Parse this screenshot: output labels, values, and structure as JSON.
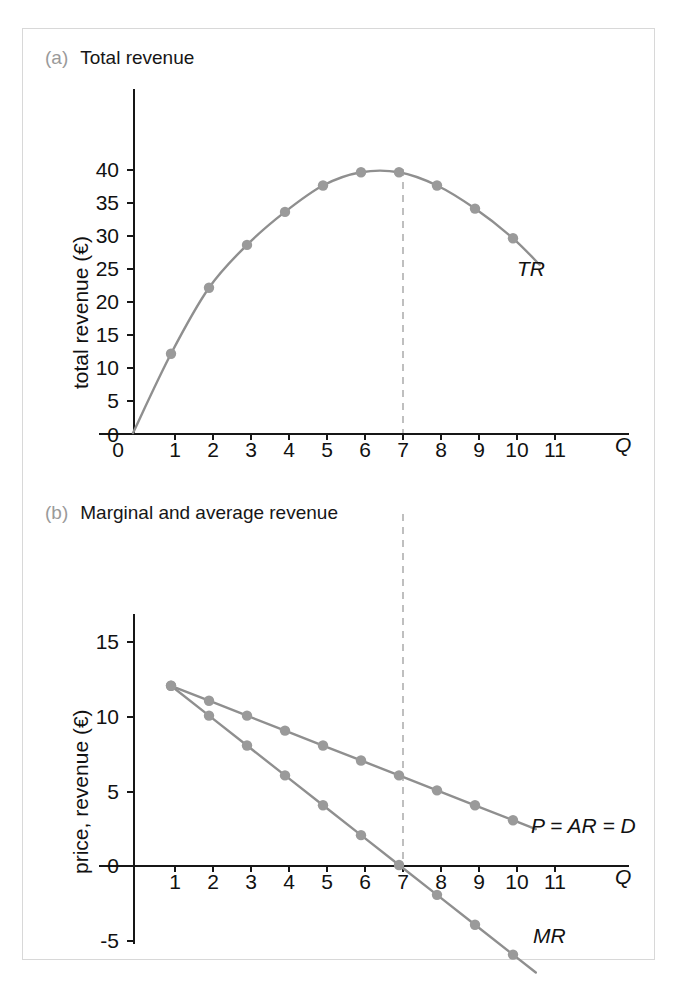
{
  "figure": {
    "panels": [
      {
        "tag": "(a)",
        "title": "Total revenue",
        "xlabel": "Q",
        "ylabel": "total revenue (€)",
        "curve_label": "TR"
      },
      {
        "tag": "(b)",
        "title": "Marginal and average revenue",
        "xlabel": "Q",
        "ylabel": "price, revenue (€)",
        "ar_label": "P = AR = D",
        "mr_label": "MR"
      }
    ],
    "colors": {
      "curve": "#8f8f8f",
      "point": "#9a9a9a",
      "axis": "#171717",
      "dashed_guide": "#b0b0b0",
      "panel_tag": "#9a9a9a",
      "frame": "#d8d8d8"
    },
    "guide_q": 7
  },
  "chart_data": [
    {
      "type": "line",
      "title": "Total revenue",
      "xlabel": "Q",
      "ylabel": "total revenue (€)",
      "xlim": [
        0,
        11.9
      ],
      "ylim": [
        0,
        44
      ],
      "xticks": [
        0,
        1,
        2,
        3,
        4,
        5,
        6,
        7,
        8,
        9,
        10,
        11
      ],
      "xtick_labels": [
        "0",
        "1",
        "2",
        "3",
        "4",
        "5",
        "6",
        "7",
        "8",
        "9",
        "10",
        "11"
      ],
      "yticks": [
        0,
        5,
        10,
        15,
        20,
        25,
        30,
        35,
        40
      ],
      "ytick_labels": [
        "0",
        "5",
        "10",
        "15",
        "20",
        "25",
        "30",
        "35",
        "40"
      ],
      "grid": false,
      "legend": "inline-curve-label",
      "series": [
        {
          "name": "TR",
          "x": [
            1,
            2,
            3,
            4,
            5,
            6,
            7,
            8,
            9,
            10
          ],
          "values": [
            12,
            22,
            28.5,
            33.5,
            37.5,
            39.5,
            39.5,
            37.5,
            34,
            29.5
          ]
        }
      ],
      "annotations": [
        {
          "text": "TR",
          "x": 10.4,
          "y": 26
        },
        {
          "text": "dashed vertical guide at Q = 7",
          "x": 7,
          "y": 39.5
        }
      ]
    },
    {
      "type": "line",
      "title": "Marginal and average revenue",
      "xlabel": "Q",
      "ylabel": "price, revenue (€)",
      "xlim": [
        0,
        11.9
      ],
      "ylim": [
        -6.5,
        17
      ],
      "xticks": [
        1,
        2,
        3,
        4,
        5,
        6,
        7,
        8,
        9,
        10,
        11
      ],
      "xtick_labels": [
        "1",
        "2",
        "3",
        "4",
        "5",
        "6",
        "7",
        "8",
        "9",
        "10",
        "11"
      ],
      "yticks": [
        -5,
        0,
        5,
        10,
        15
      ],
      "ytick_labels": [
        "-5",
        "0",
        "5",
        "10",
        "15"
      ],
      "grid": false,
      "legend": "inline-curve-label",
      "series": [
        {
          "name": "P = AR = D",
          "x": [
            1,
            2,
            3,
            4,
            5,
            6,
            7,
            8,
            9,
            10
          ],
          "values": [
            12,
            11,
            10,
            9,
            8,
            7,
            6,
            5,
            4,
            3
          ]
        },
        {
          "name": "MR",
          "x": [
            1,
            2,
            3,
            4,
            5,
            6,
            7,
            8,
            9,
            10
          ],
          "values": [
            12,
            10,
            8,
            6,
            4,
            2,
            0,
            -2,
            -4,
            -6
          ]
        }
      ],
      "annotations": [
        {
          "text": "P = AR = D",
          "x": 10.3,
          "y": 2.6
        },
        {
          "text": "MR",
          "x": 10.3,
          "y": -7
        },
        {
          "text": "dashed vertical guide at Q = 7",
          "x": 7,
          "y": 0
        }
      ]
    }
  ]
}
